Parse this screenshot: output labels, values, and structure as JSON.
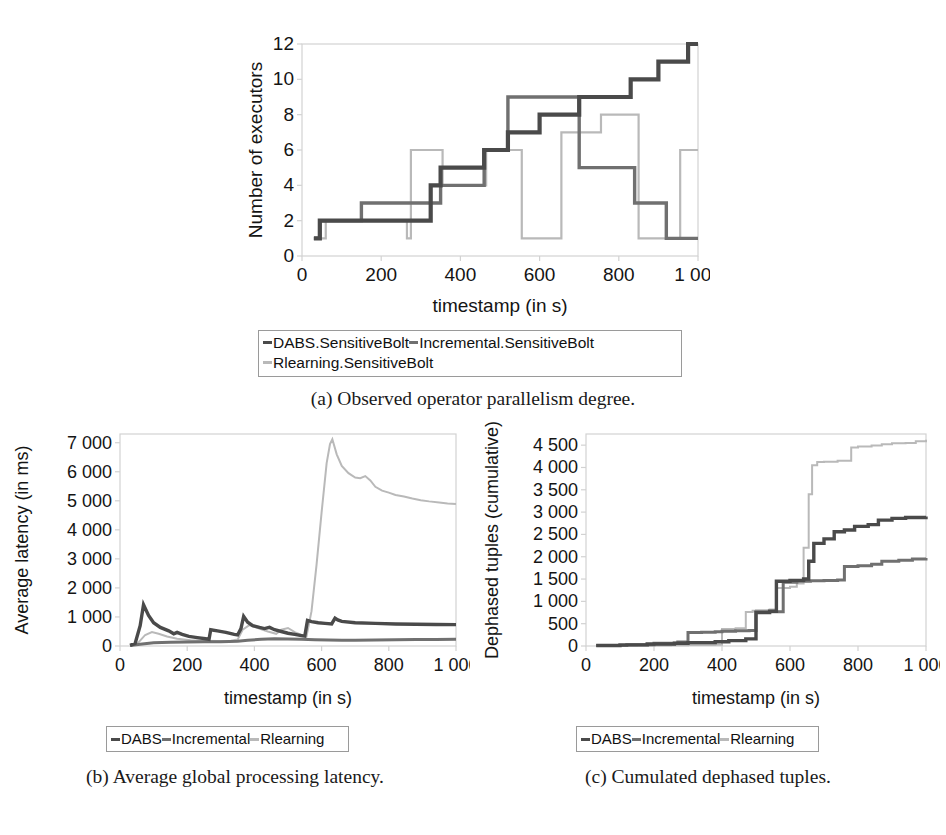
{
  "figure": {
    "panels": [
      "a",
      "b",
      "c"
    ]
  },
  "captions": {
    "a": "(a) Observed operator parallelism degree.",
    "b": "(b) Average global processing latency.",
    "c": "(c) Cumulated dephased tuples."
  },
  "colors": {
    "dabs": "#4a4a4a",
    "incremental": "#707070",
    "rlearning": "#b9b9b9",
    "axis": "#d2d2d2",
    "text": "#141414",
    "legend_border": "#9a9a9a"
  },
  "legends": {
    "a": {
      "entries": [
        {
          "label": "DABS.SensitiveBolt",
          "color_key": "dabs",
          "row": 0
        },
        {
          "label": "Incremental.SensitiveBolt",
          "color_key": "incremental",
          "row": 0
        },
        {
          "label": "Rlearning.SensitiveBolt",
          "color_key": "rlearning",
          "row": 1
        }
      ]
    },
    "b": {
      "entries": [
        {
          "label": "DABS",
          "color_key": "dabs",
          "row": 0
        },
        {
          "label": "Incremental",
          "color_key": "incremental",
          "row": 0
        },
        {
          "label": "Rlearning",
          "color_key": "rlearning",
          "row": 0
        }
      ]
    },
    "c": {
      "entries": [
        {
          "label": "DABS",
          "color_key": "dabs",
          "row": 0
        },
        {
          "label": "Incremental",
          "color_key": "incremental",
          "row": 0
        },
        {
          "label": "Rlearning",
          "color_key": "rlearning",
          "row": 0
        }
      ]
    }
  },
  "chart_data": [
    {
      "id": "a",
      "type": "line",
      "title": "",
      "xlabel": "timestamp (in s)",
      "ylabel": "Number of executors",
      "xlim": [
        0,
        1000
      ],
      "ylim": [
        0,
        12
      ],
      "xticks": [
        0,
        200,
        400,
        600,
        800,
        1000
      ],
      "xticklabels": [
        "0",
        "200",
        "400",
        "600",
        "800",
        "1 000"
      ],
      "yticks": [
        0,
        2,
        4,
        6,
        8,
        10,
        12
      ],
      "yticklabels": [
        "0",
        "2",
        "4",
        "6",
        "8",
        "10",
        "12"
      ],
      "grid": false,
      "step": true,
      "legend_position": "below",
      "series": [
        {
          "name": "DABS.SensitiveBolt",
          "color_key": "dabs",
          "x": [
            30,
            45,
            150,
            325,
            350,
            460,
            520,
            600,
            680,
            700,
            760,
            830,
            900,
            935,
            975,
            1000
          ],
          "y": [
            1,
            2,
            2,
            4,
            5,
            6,
            7,
            8,
            8,
            9,
            9,
            10,
            11,
            11,
            12,
            12
          ]
        },
        {
          "name": "Incremental.SensitiveBolt",
          "color_key": "incremental",
          "x": [
            30,
            45,
            150,
            325,
            350,
            460,
            520,
            600,
            680,
            700,
            800,
            840,
            920,
            1000
          ],
          "y": [
            1,
            2,
            3,
            3,
            4,
            6,
            9,
            9,
            9,
            5,
            5,
            3,
            1,
            1
          ]
        },
        {
          "name": "Rlearning.SensitiveBolt",
          "color_key": "rlearning",
          "x": [
            30,
            60,
            150,
            265,
            275,
            345,
            355,
            455,
            465,
            545,
            555,
            645,
            655,
            745,
            755,
            840,
            850,
            945,
            955,
            1000
          ],
          "y": [
            1,
            2,
            2,
            1,
            6,
            6,
            4,
            4,
            6,
            6,
            1,
            1,
            7,
            7,
            8,
            8,
            1,
            1,
            6,
            6
          ]
        }
      ]
    },
    {
      "id": "b",
      "type": "line",
      "title": "",
      "xlabel": "timestamp (in s)",
      "ylabel": "Average latency (in ms)",
      "xlim": [
        0,
        1000
      ],
      "ylim": [
        0,
        7300
      ],
      "xticks": [
        0,
        200,
        400,
        600,
        800,
        1000
      ],
      "xticklabels": [
        "0",
        "200",
        "400",
        "600",
        "800",
        "1 000"
      ],
      "yticks": [
        0,
        1000,
        2000,
        3000,
        4000,
        5000,
        6000,
        7000
      ],
      "yticklabels": [
        "0",
        "1 000",
        "2 000",
        "3 000",
        "4 000",
        "5 000",
        "6 000",
        "7 000"
      ],
      "grid": false,
      "step": false,
      "legend_position": "below",
      "series": [
        {
          "name": "DABS",
          "color_key": "dabs",
          "x": [
            30,
            45,
            60,
            70,
            85,
            100,
            120,
            145,
            160,
            170,
            185,
            205,
            230,
            255,
            265,
            270,
            290,
            315,
            340,
            350,
            360,
            368,
            380,
            395,
            415,
            430,
            445,
            460,
            480,
            500,
            520,
            540,
            550,
            558,
            570,
            590,
            610,
            630,
            640,
            648,
            660,
            700,
            760,
            820,
            880,
            940,
            1000
          ],
          "y": [
            20,
            90,
            700,
            1420,
            1050,
            800,
            640,
            520,
            420,
            470,
            400,
            330,
            290,
            250,
            230,
            560,
            520,
            470,
            400,
            380,
            600,
            1020,
            820,
            700,
            640,
            600,
            640,
            560,
            500,
            440,
            400,
            360,
            340,
            880,
            840,
            800,
            780,
            760,
            960,
            900,
            850,
            800,
            780,
            760,
            750,
            740,
            735
          ]
        },
        {
          "name": "Incremental",
          "color_key": "incremental",
          "x": [
            30,
            60,
            100,
            150,
            200,
            250,
            300,
            350,
            380,
            420,
            460,
            500,
            540,
            580,
            620,
            660,
            700,
            760,
            820,
            880,
            940,
            1000
          ],
          "y": [
            15,
            60,
            110,
            130,
            140,
            150,
            150,
            160,
            200,
            230,
            250,
            240,
            230,
            215,
            205,
            200,
            200,
            205,
            215,
            220,
            225,
            230
          ]
        },
        {
          "name": "Rlearning",
          "color_key": "rlearning",
          "x": [
            30,
            55,
            75,
            95,
            115,
            140,
            170,
            210,
            250,
            290,
            330,
            350,
            365,
            385,
            410,
            440,
            465,
            480,
            500,
            520,
            540,
            555,
            570,
            585,
            600,
            615,
            625,
            632,
            645,
            660,
            680,
            700,
            715,
            730,
            745,
            760,
            780,
            800,
            820,
            845,
            870,
            895,
            920,
            950,
            975,
            1000
          ],
          "y": [
            10,
            120,
            380,
            480,
            420,
            330,
            250,
            200,
            180,
            170,
            180,
            220,
            560,
            720,
            620,
            500,
            420,
            560,
            620,
            480,
            380,
            330,
            1200,
            2800,
            4600,
            6300,
            6950,
            7120,
            6600,
            6200,
            5950,
            5800,
            5780,
            5850,
            5700,
            5480,
            5350,
            5280,
            5200,
            5150,
            5080,
            5020,
            4980,
            4940,
            4910,
            4890
          ]
        }
      ]
    },
    {
      "id": "c",
      "type": "line",
      "title": "",
      "xlabel": "timestamp (in s)",
      "ylabel": "Dephased tuples (cumulative)",
      "xlim": [
        0,
        1000
      ],
      "ylim": [
        0,
        4750
      ],
      "xticks": [
        0,
        200,
        400,
        600,
        800,
        1000
      ],
      "xticklabels": [
        "0",
        "200",
        "400",
        "600",
        "800",
        "1 000"
      ],
      "yticks": [
        0,
        500,
        1000,
        1500,
        2000,
        2500,
        3000,
        3500,
        4000,
        4500
      ],
      "yticklabels": [
        "0",
        "500",
        "1 000",
        "1 500",
        "2 000",
        "2 500",
        "3 000",
        "3 500",
        "4 000",
        "4 500"
      ],
      "grid": false,
      "step": true,
      "legend_position": "below",
      "series": [
        {
          "name": "DABS",
          "color_key": "dabs",
          "x": [
            30,
            100,
            180,
            260,
            300,
            380,
            420,
            470,
            500,
            540,
            560,
            600,
            640,
            655,
            670,
            700,
            730,
            760,
            790,
            830,
            860,
            900,
            940,
            1000
          ],
          "y": [
            10,
            25,
            45,
            60,
            75,
            95,
            120,
            160,
            750,
            780,
            1450,
            1470,
            1500,
            1900,
            2300,
            2400,
            2560,
            2600,
            2680,
            2720,
            2820,
            2860,
            2880,
            2900
          ]
        },
        {
          "name": "Incremental",
          "color_key": "incremental",
          "x": [
            30,
            120,
            200,
            270,
            300,
            340,
            380,
            400,
            440,
            480,
            500,
            540,
            580,
            620,
            660,
            700,
            740,
            760,
            800,
            840,
            870,
            920,
            960,
            1000
          ],
          "y": [
            10,
            30,
            60,
            90,
            300,
            310,
            320,
            330,
            340,
            350,
            760,
            770,
            1430,
            1450,
            1460,
            1470,
            1480,
            1780,
            1800,
            1830,
            1900,
            1920,
            1950,
            1970
          ]
        },
        {
          "name": "Rlearning",
          "color_key": "rlearning",
          "x": [
            30,
            150,
            250,
            300,
            360,
            380,
            400,
            440,
            470,
            490,
            500,
            540,
            560,
            600,
            620,
            640,
            655,
            665,
            680,
            700,
            740,
            780,
            800,
            840,
            870,
            900,
            940,
            970,
            1000
          ],
          "y": [
            5,
            10,
            15,
            20,
            25,
            30,
            380,
            400,
            760,
            790,
            800,
            820,
            1300,
            1330,
            1400,
            2200,
            3400,
            4050,
            4120,
            4130,
            4150,
            4450,
            4470,
            4490,
            4520,
            4540,
            4550,
            4590,
            4620
          ]
        }
      ]
    }
  ]
}
